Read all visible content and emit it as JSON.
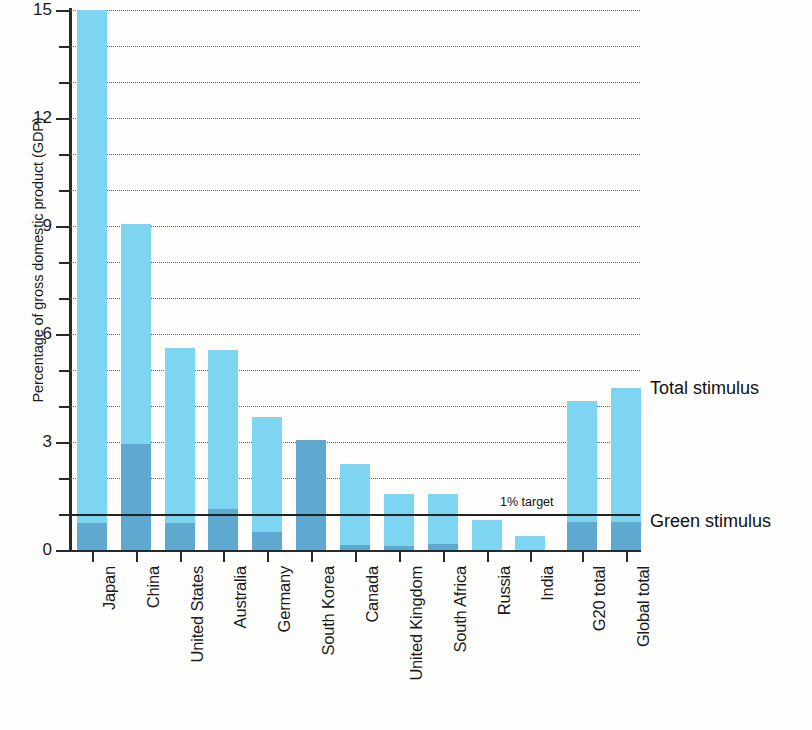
{
  "chart_data": {
    "type": "bar",
    "subtype": "stacked",
    "title": "",
    "xlabel": "",
    "ylabel": "Percentage of gross domestic product (GDP)",
    "ylim": [
      0,
      15
    ],
    "ytick_labels": [
      "0",
      "3",
      "6",
      "9",
      "12",
      "15"
    ],
    "ytick_values": [
      0,
      3,
      6,
      9,
      12,
      15
    ],
    "minor_tick_values": [
      1,
      2,
      4,
      5,
      7,
      8,
      10,
      11,
      13,
      14
    ],
    "grid": "horizontal-dotted",
    "legend_position": "right",
    "categories": [
      "Japan",
      "China",
      "United States",
      "Australia",
      "Germany",
      "South Korea",
      "Canada",
      "United Kingdom",
      "South Africa",
      "Russia",
      "India",
      "G20 total",
      "Global total"
    ],
    "series": [
      {
        "name": "Total stimulus",
        "color": "#7ed5f2",
        "values": [
          15.0,
          9.05,
          5.6,
          5.55,
          3.7,
          3.05,
          2.4,
          1.55,
          1.55,
          0.82,
          0.4,
          4.15,
          4.5
        ]
      },
      {
        "name": "Green stimulus",
        "color": "#5fa8cf",
        "values": [
          0.75,
          2.95,
          0.75,
          1.15,
          0.5,
          3.05,
          0.15,
          0.12,
          0.18,
          0.0,
          0.0,
          0.78,
          0.78
        ]
      }
    ],
    "annotations": [
      {
        "text": "1% target",
        "value": 1.0,
        "type": "hline"
      }
    ]
  },
  "legend": {
    "total_label": "Total stimulus",
    "green_label": "Green stimulus"
  }
}
